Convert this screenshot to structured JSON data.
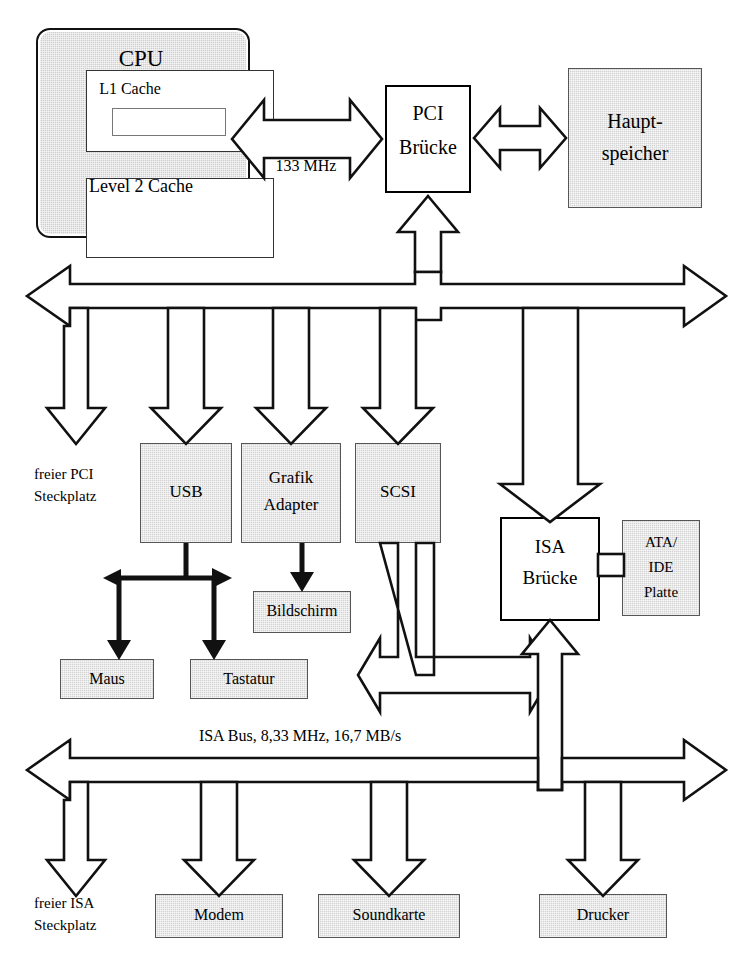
{
  "diagram": {
    "cpu": {
      "package_label": "CPU",
      "l1_label": "L1 Cache",
      "l2_label": "Level 2 Cache"
    },
    "bridges": {
      "pci": "PCI\nBrücke",
      "pci_line1": "PCI",
      "pci_line2": "Brücke",
      "isa_line1": "ISA",
      "isa_line2": "Brücke"
    },
    "memory": {
      "line1": "Haupt-",
      "line2": "speicher"
    },
    "buses": {
      "system_bus_line1": "System-Bus",
      "system_bus_line2": "133 MHz",
      "pci_bus": "PCI Bus, 33 MHz, 133 MB/s",
      "isa_bus": "ISA Bus, 8,33 MHz, 16,7 MB/s"
    },
    "pci_devices": [
      {
        "name": "freier-pci-slot",
        "line1": "freier PCI",
        "line2": "Steckplatz",
        "style": "text"
      },
      {
        "name": "usb",
        "line1": "USB",
        "line2": "",
        "style": "gray"
      },
      {
        "name": "grafik-adapter",
        "line1": "Grafik",
        "line2": "Adapter",
        "style": "gray"
      },
      {
        "name": "scsi",
        "line1": "SCSI",
        "line2": "",
        "style": "gray"
      }
    ],
    "usb_devices": [
      {
        "name": "maus",
        "label": "Maus"
      },
      {
        "name": "tastatur",
        "label": "Tastatur"
      }
    ],
    "display": {
      "label": "Bildschirm"
    },
    "storage": {
      "line1": "ATA/",
      "line2": "IDE",
      "line3": "Platte"
    },
    "isa_devices": [
      {
        "name": "freier-isa-slot",
        "line1": "freier ISA",
        "line2": "Steckplatz",
        "style": "text"
      },
      {
        "name": "modem",
        "line1": "Modem",
        "line2": "",
        "style": "gray"
      },
      {
        "name": "soundkarte",
        "line1": "Soundkarte",
        "line2": "",
        "style": "gray"
      },
      {
        "name": "drucker",
        "line1": "Drucker",
        "line2": "",
        "style": "gray"
      }
    ],
    "colors": {
      "device_fill": "#d4d4d4",
      "outline": "#111111",
      "background": "#ffffff"
    }
  }
}
